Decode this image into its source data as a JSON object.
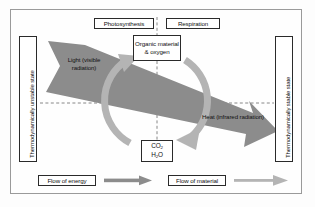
{
  "diagram": {
    "title_top_left": "Photosynthesis",
    "title_top_right": "Respiration",
    "boxes": {
      "organic": "Organic material & oxygen",
      "co2_line1": "CO",
      "co2_sub1": "2",
      "co2_line2": "H",
      "co2_sub2": "2",
      "co2_line2_end": "O"
    },
    "band_labels": {
      "light": "Light (visible radiation)",
      "heat": "Heat (infrared radiation)"
    },
    "axes": {
      "left": "Thermodynamically unstable state",
      "right": "Thermodynamically stable state"
    },
    "legend": {
      "energy": "Flow of energy",
      "material": "Flow of material"
    },
    "colors": {
      "energy_band": "#8c8c8c",
      "material_arrow": "#b4b4b4",
      "frame_border": "#9a9a9a",
      "text": "#111111",
      "dashed_line": "#6b6b6b",
      "page_background": "#fdfdfd"
    }
  }
}
